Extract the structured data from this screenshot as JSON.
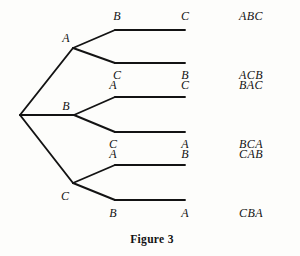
{
  "figure": {
    "caption": "Figure 3",
    "caption_x": 152,
    "caption_y": 239,
    "background_color": "#fdfdfb",
    "ink_color": "#131313",
    "width": 300,
    "height": 256
  },
  "tree": {
    "root": {
      "x": 20,
      "y": 115
    },
    "stroke_color": "#131313",
    "stroke_width": 1.9,
    "level1": [
      {
        "id": "A",
        "label": "A",
        "node_x": 73,
        "node_y": 48,
        "label_x": 66,
        "label_y": 38
      },
      {
        "id": "B",
        "label": "B",
        "node_x": 74,
        "node_y": 115,
        "label_x": 66,
        "label_y": 106
      },
      {
        "id": "C",
        "label": "C",
        "node_x": 73,
        "node_y": 183,
        "label_x": 65,
        "label_y": 196
      }
    ],
    "level2": [
      {
        "parent": "A",
        "label": "B",
        "bend_x": 115,
        "end_x": 185,
        "y": 30,
        "label_x": 117,
        "label_y": 16
      },
      {
        "parent": "A",
        "label": "C",
        "bend_x": 115,
        "end_x": 185,
        "y": 63,
        "label_x": 117,
        "label_y": 75
      },
      {
        "parent": "B",
        "label": "A",
        "bend_x": 115,
        "end_x": 185,
        "y": 97,
        "label_x": 113,
        "label_y": 85
      },
      {
        "parent": "B",
        "label": "C",
        "bend_x": 115,
        "end_x": 185,
        "y": 132,
        "label_x": 113,
        "label_y": 144
      },
      {
        "parent": "C",
        "label": "A",
        "bend_x": 115,
        "end_x": 185,
        "y": 165,
        "label_x": 113,
        "label_y": 154
      },
      {
        "parent": "C",
        "label": "B",
        "bend_x": 115,
        "end_x": 185,
        "y": 200,
        "label_x": 113,
        "label_y": 213
      }
    ],
    "terminals": [
      {
        "label": "C",
        "x": 185,
        "y": 16
      },
      {
        "label": "B",
        "x": 185,
        "y": 75
      },
      {
        "label": "C",
        "x": 185,
        "y": 85
      },
      {
        "label": "A",
        "x": 185,
        "y": 144
      },
      {
        "label": "B",
        "x": 185,
        "y": 154
      },
      {
        "label": "A",
        "x": 185,
        "y": 213
      }
    ],
    "outcomes": [
      {
        "label": "ABC",
        "x": 251,
        "y": 16
      },
      {
        "label": "ACB",
        "x": 251,
        "y": 75
      },
      {
        "label": "BAC",
        "x": 251,
        "y": 85
      },
      {
        "label": "BCA",
        "x": 251,
        "y": 144
      },
      {
        "label": "CAB",
        "x": 251,
        "y": 154
      },
      {
        "label": "CBA",
        "x": 251,
        "y": 213
      }
    ]
  }
}
